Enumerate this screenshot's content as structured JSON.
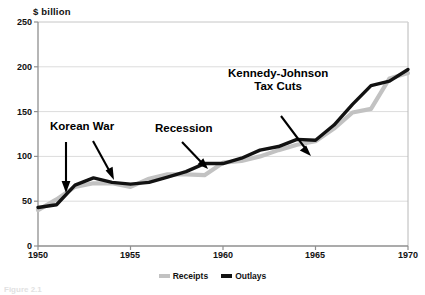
{
  "chart_data": {
    "type": "line",
    "title": "",
    "subtitle": "",
    "unit_label": "$  billion",
    "xlabel": "",
    "ylabel": "",
    "xlim": [
      1950,
      1970
    ],
    "ylim": [
      0,
      250
    ],
    "xticks": [
      1950,
      1955,
      1960,
      1965,
      1970
    ],
    "yticks": [
      0,
      50,
      100,
      150,
      200,
      250
    ],
    "xtick_labels": [
      "1950",
      "1955",
      "1960",
      "1965",
      "1970"
    ],
    "ytick_labels": [
      "0",
      "50",
      "100",
      "150",
      "200",
      "250"
    ],
    "grid": "horizontal",
    "legend_position": "bottom-center",
    "x": [
      1950,
      1951,
      1952,
      1953,
      1954,
      1955,
      1956,
      1957,
      1958,
      1959,
      1960,
      1961,
      1962,
      1963,
      1964,
      1965,
      1966,
      1967,
      1968,
      1969,
      1970
    ],
    "series": [
      {
        "name": "Receipts",
        "color": "#c2c2c2",
        "values": [
          40,
          52,
          66,
          70,
          70,
          66,
          75,
          80,
          80,
          79,
          93,
          95,
          100,
          107,
          113,
          117,
          131,
          149,
          153,
          187,
          193
        ]
      },
      {
        "name": "Outlays",
        "color": "#121212",
        "values": [
          43,
          46,
          68,
          76,
          71,
          69,
          71,
          77,
          83,
          92,
          92,
          98,
          107,
          111,
          119,
          118,
          135,
          158,
          179,
          184,
          197
        ]
      }
    ],
    "annotations": [
      {
        "id": "korean-war",
        "text": "Korean War",
        "arrows": 2
      },
      {
        "id": "recession",
        "text": "Recession",
        "arrows": 1
      },
      {
        "id": "kennedy-johnson-tax-cuts",
        "text": "Kennedy-Johnson\nTax Cuts",
        "line1": "Kennedy-Johnson",
        "line2": "Tax Cuts",
        "arrows": 1
      }
    ]
  },
  "legend": {
    "items": [
      {
        "label": "Receipts",
        "color": "#c2c2c2"
      },
      {
        "label": "Outlays",
        "color": "#121212"
      }
    ]
  },
  "annotations": {
    "korean_war": "Korean War",
    "recession": "Recession",
    "tax_cuts_line1": "Kennedy-Johnson",
    "tax_cuts_line2": "Tax Cuts"
  },
  "axes": {
    "unit_label": "$  billion",
    "ytick_0": "0",
    "ytick_1": "50",
    "ytick_2": "100",
    "ytick_3": "150",
    "ytick_4": "200",
    "ytick_5": "250",
    "xtick_0": "1950",
    "xtick_1": "1955",
    "xtick_2": "1960",
    "xtick_3": "1965",
    "xtick_4": "1970"
  },
  "caption": {
    "text": "Figure  2.1"
  },
  "colors": {
    "receipts": "#c2c2c2",
    "outlays": "#121212",
    "grid": "#dcdcdc",
    "axis": "#9a9a9a",
    "border": "#b0b0b0"
  }
}
